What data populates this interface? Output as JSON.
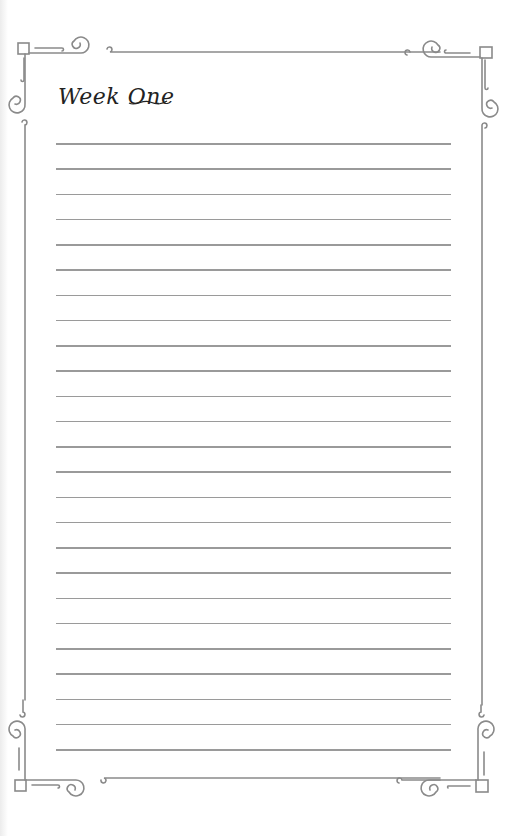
{
  "page": {
    "title": "Week One",
    "line_count": 25,
    "first_line_y": 143,
    "line_spacing": 25.25,
    "line_color": "#9a9a9a",
    "border_color": "#888888"
  }
}
